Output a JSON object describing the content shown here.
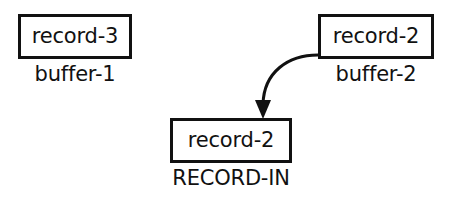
{
  "diagram": {
    "background_color": "#ffffff",
    "stroke_color": "#111111",
    "nodes": [
      {
        "id": "buffer-1",
        "box_label": "record-3",
        "caption": "buffer-1"
      },
      {
        "id": "buffer-2",
        "box_label": "record-2",
        "caption": "buffer-2"
      },
      {
        "id": "record-in",
        "box_label": "record-2",
        "caption": "RECORD-IN"
      }
    ],
    "edges": [
      {
        "id": "buffer2-to-record-in",
        "from": "buffer-2",
        "to": "record-in",
        "style": "curved",
        "arrowhead": "filled-triangle",
        "direction": "down"
      }
    ]
  }
}
